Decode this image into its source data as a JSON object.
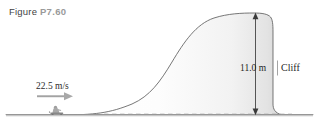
{
  "figure": {
    "caption_word": "Figure",
    "caption_number": "P7.60"
  },
  "annotations": {
    "speed": "22.5 m/s",
    "height": "11.0 m",
    "cliff": "Cliff"
  },
  "colors": {
    "outline": "#5a5a5a",
    "ground": "#8a8a8a",
    "dashed": "#9a9a9a",
    "arrow": "#9e9e9e",
    "dimension_arrow": "#3a3a3a",
    "caption_word": "#3f3f3f",
    "caption_number": "#9a9a9a",
    "text": "#1f1f1f",
    "hill_fill": "#fbfbfb"
  },
  "scene": {
    "description": "side-view of a sledder approaching a hill that rises to a flat plateau ending in a vertical cliff",
    "ground_level": "baseline",
    "sled_rider": "person-on-sled"
  }
}
